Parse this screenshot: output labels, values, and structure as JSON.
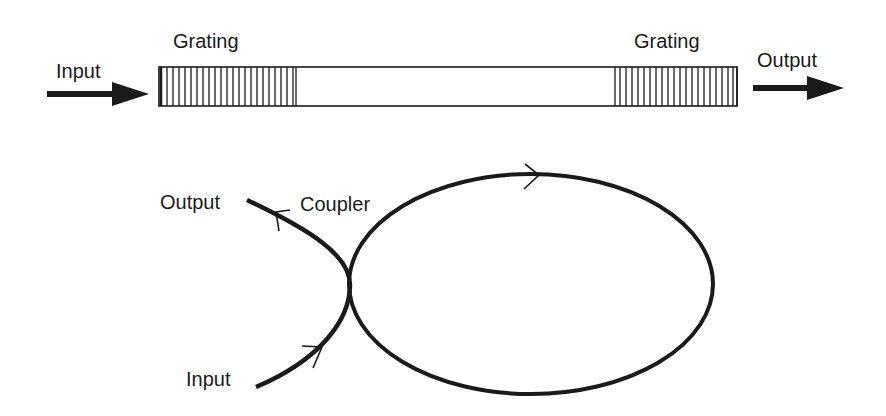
{
  "top_diagram": {
    "input_label": "Input",
    "output_label": "Output",
    "grating_left_label": "Grating",
    "grating_right_label": "Grating"
  },
  "bottom_diagram": {
    "output_label": "Output",
    "coupler_label": "Coupler",
    "input_label": "Input"
  },
  "colors": {
    "stroke": "#1a1a1a",
    "background": "#ffffff"
  }
}
